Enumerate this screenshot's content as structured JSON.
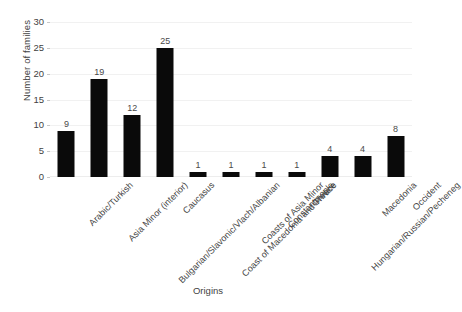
{
  "chart_data": {
    "type": "bar",
    "title": "",
    "xlabel": "Origins",
    "ylabel": "Number of families",
    "categories": [
      "Arabic/Turkish",
      "Asia Minor (interior)",
      "Bulgarian/Slavonic/Vlach/Albanian",
      "Caucasus",
      "Coast of Macedonia and Thrace",
      "Coasts of Asia Minor",
      "Constantinople",
      "Greece",
      "Hungarian/Russian/Pecheneg",
      "Macedonia",
      "Occident"
    ],
    "values": [
      9,
      19,
      12,
      25,
      1,
      1,
      1,
      1,
      4,
      4,
      8
    ],
    "value_labels": [
      "9",
      "19",
      "12",
      "25",
      "1",
      "1",
      "1",
      "1",
      "4",
      "4",
      "8"
    ],
    "ylim": [
      0,
      30
    ],
    "ytick_labels": [
      "0",
      "5",
      "10",
      "15",
      "20",
      "25",
      "30"
    ],
    "ytick_values": [
      0,
      5,
      10,
      15,
      20,
      25,
      30
    ],
    "grid": true,
    "legend": "none",
    "bar_color": "#0a0a0a",
    "background_color": "#ffffff",
    "gridline_color": "#f1f1f1",
    "text_color": "#3f3f3f"
  }
}
